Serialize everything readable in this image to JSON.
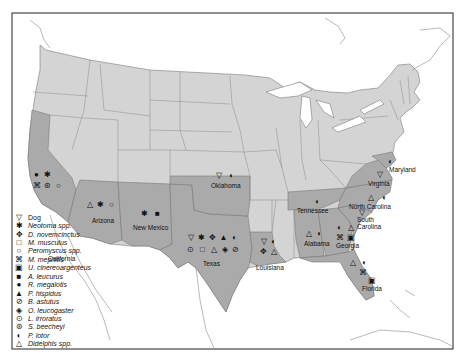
{
  "map": {
    "frame": {
      "x": 12,
      "y": 13,
      "w": 441,
      "h": 336
    },
    "colors": {
      "background": "#ffffff",
      "land": "#d3d3d3",
      "highlight": "#a9a9a9",
      "border": "#777777",
      "frame": "#222222"
    },
    "states": [
      {
        "name": "California",
        "label_x": 48,
        "label_y": 258,
        "symbols": [
          {
            "glyph": "●",
            "taxon": "R. megalotis",
            "x": 36,
            "y": 175
          },
          {
            "glyph": "✱",
            "taxon": "Neotoma spp.",
            "x": 47,
            "y": 175
          },
          {
            "glyph": "⌘",
            "taxon": "M. mephitis",
            "x": 36,
            "y": 186
          },
          {
            "glyph": "⊛",
            "taxon": "S. beecheyi",
            "x": 47,
            "y": 186
          },
          {
            "glyph": "○",
            "taxon": "Peromyscus spp.",
            "x": 58,
            "y": 186
          }
        ]
      },
      {
        "name": "Arizona",
        "label_x": 93,
        "label_y": 220,
        "symbols": [
          {
            "glyph": "△",
            "taxon": "Didelphis spp.",
            "x": 89,
            "y": 205
          },
          {
            "glyph": "✱",
            "taxon": "Neotoma spp.",
            "x": 100,
            "y": 205
          },
          {
            "glyph": "○",
            "taxon": "Peromyscus spp.",
            "x": 111,
            "y": 205
          }
        ]
      },
      {
        "name": "New Mexico",
        "label_x": 135,
        "label_y": 227,
        "symbols": [
          {
            "glyph": "✱",
            "taxon": "Neotoma spp.",
            "x": 140,
            "y": 212
          },
          {
            "glyph": "■",
            "taxon": "A. leucurus",
            "x": 153,
            "y": 212
          }
        ]
      },
      {
        "name": "Oklahoma",
        "label_x": 213,
        "label_y": 184,
        "symbols": [
          {
            "glyph": "▽",
            "taxon": "Dog",
            "x": 214,
            "y": 174
          },
          {
            "glyph": "◐",
            "taxon": "P. lotor",
            "x": 227,
            "y": 174
          }
        ]
      },
      {
        "name": "Texas",
        "label_x": 201,
        "label_y": 262,
        "symbols": [
          {
            "glyph": "▽",
            "taxon": "Dog",
            "x": 186,
            "y": 236
          },
          {
            "glyph": "✱",
            "taxon": "Neotoma spp.",
            "x": 197,
            "y": 236
          },
          {
            "glyph": "✥",
            "taxon": "D. novemcinctus",
            "x": 208,
            "y": 236
          },
          {
            "glyph": "▲",
            "taxon": "P. hispidus",
            "x": 219,
            "y": 236
          },
          {
            "glyph": "◐",
            "taxon": "P. lotor",
            "x": 230,
            "y": 236
          },
          {
            "glyph": "⊙",
            "taxon": "L. irroratus",
            "x": 186,
            "y": 247
          },
          {
            "glyph": "□",
            "taxon": "M. musculus",
            "x": 198,
            "y": 247
          },
          {
            "glyph": "△",
            "taxon": "Didelphis spp.",
            "x": 209,
            "y": 247
          },
          {
            "glyph": "◈",
            "taxon": "O. leucogaster",
            "x": 220,
            "y": 247
          },
          {
            "glyph": "⊘",
            "taxon": "B. astutus",
            "x": 231,
            "y": 247
          }
        ]
      },
      {
        "name": "Louisiana",
        "label_x": 258,
        "label_y": 266,
        "symbols": [
          {
            "glyph": "▽",
            "taxon": "Dog",
            "x": 259,
            "y": 239
          },
          {
            "glyph": "◐",
            "taxon": "P. lotor",
            "x": 269,
            "y": 239
          },
          {
            "glyph": "✥",
            "taxon": "D. novemcinctus",
            "x": 259,
            "y": 249
          },
          {
            "glyph": "△",
            "taxon": "Didelphis spp.",
            "x": 269,
            "y": 249
          }
        ]
      },
      {
        "name": "Tennessee",
        "label_x": 298,
        "label_y": 208,
        "symbols": [
          {
            "glyph": "◐",
            "taxon": "P. lotor",
            "x": 313,
            "y": 198
          }
        ]
      },
      {
        "name": "Alabama",
        "label_x": 303,
        "label_y": 242,
        "symbols": [
          {
            "glyph": "△",
            "taxon": "Didelphis spp.",
            "x": 304,
            "y": 230
          },
          {
            "glyph": "◐",
            "taxon": "P. lotor",
            "x": 315,
            "y": 230
          }
        ]
      },
      {
        "name": "Georgia",
        "label_x": 336,
        "label_y": 244,
        "symbols": [
          {
            "glyph": "◐",
            "taxon": "P. lotor",
            "x": 335,
            "y": 224
          },
          {
            "glyph": "△",
            "taxon": "Didelphis spp.",
            "x": 346,
            "y": 224
          },
          {
            "glyph": "⌘",
            "taxon": "M. mephitis",
            "x": 335,
            "y": 234
          },
          {
            "glyph": "▣",
            "taxon": "U. cinereoargenteus",
            "x": 346,
            "y": 234
          }
        ]
      },
      {
        "name": "Florida",
        "label_x": 362,
        "label_y": 287,
        "symbols": [
          {
            "glyph": "△",
            "taxon": "Didelphis spp.",
            "x": 348,
            "y": 259
          },
          {
            "glyph": "◐",
            "taxon": "P. lotor",
            "x": 360,
            "y": 259
          },
          {
            "glyph": "⌘",
            "taxon": "M. mephitis",
            "x": 358,
            "y": 269
          },
          {
            "glyph": "▣",
            "taxon": "U. cinereoargenteus",
            "x": 367,
            "y": 277
          }
        ]
      },
      {
        "name": "South Carolina",
        "label_line1": "South",
        "label_line2": "Carolina",
        "label_x": 357,
        "label_y": 218,
        "symbols": [
          {
            "glyph": "▽",
            "taxon": "Dog",
            "x": 357,
            "y": 209
          }
        ]
      },
      {
        "name": "North Carolina",
        "label_x": 348,
        "label_y": 201,
        "symbols": [
          {
            "glyph": "△",
            "taxon": "Didelphis spp.",
            "x": 366,
            "y": 195
          },
          {
            "glyph": "◐",
            "taxon": "P. lotor",
            "x": 380,
            "y": 195
          }
        ]
      },
      {
        "name": "Virginia",
        "label_x": 368,
        "label_y": 183,
        "symbols": [
          {
            "glyph": "▽",
            "taxon": "Dog",
            "x": 375,
            "y": 172
          }
        ]
      },
      {
        "name": "Maryland",
        "label_x": 389,
        "label_y": 166,
        "symbols": [
          {
            "glyph": "◐",
            "taxon": "P. lotor",
            "x": 386,
            "y": 158
          }
        ]
      }
    ]
  },
  "legend": {
    "items": [
      {
        "icon": "dog-icon",
        "glyph": "▽",
        "label": "Dog"
      },
      {
        "icon": "neotoma-icon",
        "glyph": "✱",
        "label": "Neotoma spp."
      },
      {
        "icon": "dasypus-icon",
        "glyph": "✥",
        "label": "D. novemcinctus"
      },
      {
        "icon": "mus-icon",
        "glyph": "□",
        "label": "M. musculus"
      },
      {
        "icon": "peromyscus-icon",
        "glyph": "○",
        "label": "Peromyscus spp."
      },
      {
        "icon": "mephitis-icon",
        "glyph": "⌘",
        "label": "M. mephitis"
      },
      {
        "icon": "urocyon-icon",
        "glyph": "▣",
        "label": "U. cinereoargenteus"
      },
      {
        "icon": "ammospermophilus-icon",
        "glyph": "■",
        "label": "A. leucurus"
      },
      {
        "icon": "reithrodontomys-icon",
        "glyph": "●",
        "label": "R. megalotis"
      },
      {
        "icon": "sigmodon-icon",
        "glyph": "▲",
        "label": "P. hispidus"
      },
      {
        "icon": "bassariscus-icon",
        "glyph": "⊘",
        "label": "B. astutus"
      },
      {
        "icon": "onychomys-icon",
        "glyph": "◈",
        "label": "O. leucogaster"
      },
      {
        "icon": "liomys-icon",
        "glyph": "⊙",
        "label": "L. irroratus"
      },
      {
        "icon": "spermophilus-icon",
        "glyph": "⊛",
        "label": "S. beecheyi"
      },
      {
        "icon": "procyon-icon",
        "glyph": "◐",
        "label": "P. lotor"
      },
      {
        "icon": "didelphis-icon",
        "glyph": "△",
        "label": "Didelphis spp."
      }
    ]
  }
}
